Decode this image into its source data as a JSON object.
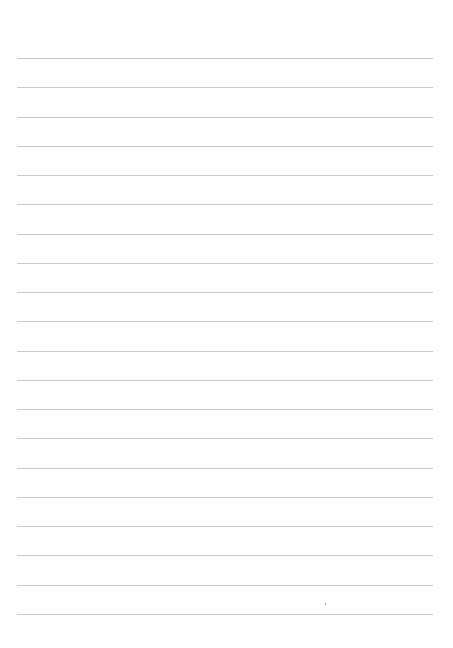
{
  "page": {
    "type": "lined-paper",
    "background_color": "#fefefe",
    "line_color": "#c9c9c9",
    "line_count": 20,
    "first_line_y": 58,
    "line_spacing": 29.26,
    "line_left": 17,
    "line_width": 416
  }
}
